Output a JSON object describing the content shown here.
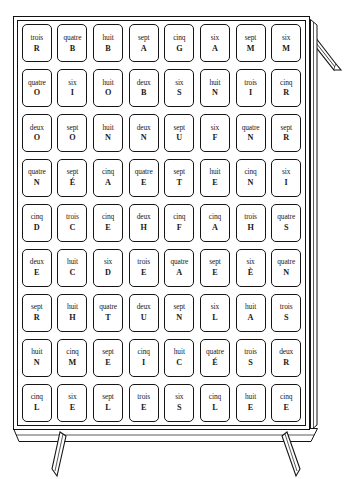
{
  "illustration": {
    "title": "Grille de cartes sur chevalet",
    "subject": "whiteboard-easel-with-card-grid",
    "style": "line-art-black-and-white",
    "colors": {
      "ink": "#141414",
      "paper": "#ffffff"
    }
  },
  "board": {
    "rows": 9,
    "columns": 8,
    "total_cards": 72,
    "frame_label": "board-frame",
    "easel_arm_label": "easel-arm",
    "legs": [
      {
        "name": "left-leg"
      },
      {
        "name": "right-leg"
      }
    ]
  },
  "grid": {
    "cards": [
      [
        {
          "word": "trois",
          "letter": "R"
        },
        {
          "word": "quatre",
          "letter": "B"
        },
        {
          "word": "huit",
          "letter": "B"
        },
        {
          "word": "sept",
          "letter": "A"
        },
        {
          "word": "cinq",
          "letter": "G"
        },
        {
          "word": "six",
          "letter": "A"
        },
        {
          "word": "sept",
          "letter": "M"
        },
        {
          "word": "six",
          "letter": "M"
        }
      ],
      [
        {
          "word": "quatre",
          "letter": "O"
        },
        {
          "word": "six",
          "letter": "I"
        },
        {
          "word": "huit",
          "letter": "O"
        },
        {
          "word": "deux",
          "letter": "B"
        },
        {
          "word": "six",
          "letter": "S"
        },
        {
          "word": "huit",
          "letter": "N"
        },
        {
          "word": "trois",
          "letter": "I"
        },
        {
          "word": "cinq",
          "letter": "R"
        }
      ],
      [
        {
          "word": "deux",
          "letter": "O"
        },
        {
          "word": "sept",
          "letter": "O"
        },
        {
          "word": "huit",
          "letter": "N"
        },
        {
          "word": "deux",
          "letter": "N"
        },
        {
          "word": "sept",
          "letter": "U"
        },
        {
          "word": "six",
          "letter": "F"
        },
        {
          "word": "quatre",
          "letter": "N"
        },
        {
          "word": "sept",
          "letter": "R"
        }
      ],
      [
        {
          "word": "quatre",
          "letter": "N"
        },
        {
          "word": "sept",
          "letter": "É"
        },
        {
          "word": "cinq",
          "letter": "A"
        },
        {
          "word": "quatre",
          "letter": "E"
        },
        {
          "word": "sept",
          "letter": "T"
        },
        {
          "word": "huit",
          "letter": "E"
        },
        {
          "word": "cinq",
          "letter": "N"
        },
        {
          "word": "six",
          "letter": "I"
        }
      ],
      [
        {
          "word": "cinq",
          "letter": "D"
        },
        {
          "word": "trois",
          "letter": "C"
        },
        {
          "word": "cinq",
          "letter": "E"
        },
        {
          "word": "deux",
          "letter": "H"
        },
        {
          "word": "cinq",
          "letter": "F"
        },
        {
          "word": "cinq",
          "letter": "A"
        },
        {
          "word": "trois",
          "letter": "H"
        },
        {
          "word": "quatre",
          "letter": "S"
        }
      ],
      [
        {
          "word": "deux",
          "letter": "E"
        },
        {
          "word": "huit",
          "letter": "C"
        },
        {
          "word": "six",
          "letter": "D"
        },
        {
          "word": "trois",
          "letter": "E"
        },
        {
          "word": "quatre",
          "letter": "A"
        },
        {
          "word": "sept",
          "letter": "E"
        },
        {
          "word": "six",
          "letter": "È"
        },
        {
          "word": "quatre",
          "letter": "N"
        }
      ],
      [
        {
          "word": "sept",
          "letter": "R"
        },
        {
          "word": "huit",
          "letter": "H"
        },
        {
          "word": "quatre",
          "letter": "T"
        },
        {
          "word": "deux",
          "letter": "U"
        },
        {
          "word": "sept",
          "letter": "N"
        },
        {
          "word": "six",
          "letter": "L"
        },
        {
          "word": "huit",
          "letter": "A"
        },
        {
          "word": "trois",
          "letter": "S"
        }
      ],
      [
        {
          "word": "huit",
          "letter": "N"
        },
        {
          "word": "cinq",
          "letter": "M"
        },
        {
          "word": "sept",
          "letter": "E"
        },
        {
          "word": "cinq",
          "letter": "I"
        },
        {
          "word": "huit",
          "letter": "C"
        },
        {
          "word": "quatre",
          "letter": "É"
        },
        {
          "word": "trois",
          "letter": "S"
        },
        {
          "word": "deux",
          "letter": "R"
        }
      ],
      [
        {
          "word": "cinq",
          "letter": "L"
        },
        {
          "word": "six",
          "letter": "E"
        },
        {
          "word": "sept",
          "letter": "L"
        },
        {
          "word": "trois",
          "letter": "E"
        },
        {
          "word": "six",
          "letter": "S"
        },
        {
          "word": "cinq",
          "letter": "L"
        },
        {
          "word": "huit",
          "letter": "E"
        },
        {
          "word": "cinq",
          "letter": "E"
        }
      ]
    ]
  }
}
